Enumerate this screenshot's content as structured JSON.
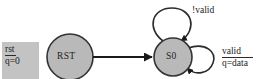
{
  "diagram": {
    "type": "finite-state-machine",
    "canvas": {
      "width": 263,
      "height": 79,
      "background": "#ffffff"
    },
    "colors": {
      "state_fill": "#b9b9b9",
      "state_stroke": "#333333",
      "loop_stroke": "#2b2b2b",
      "arrow": "#1a1a1a",
      "label_box_fill": "#c3c3c3",
      "text": "#1a1a1a"
    },
    "states": [
      {
        "id": "rst",
        "label": "RST",
        "cx": 70,
        "cy": 57,
        "r": 23
      },
      {
        "id": "s0",
        "label": "S0",
        "cx": 173,
        "cy": 57,
        "r": 19
      }
    ],
    "reset_label": {
      "name": "reset-condition",
      "numerator": "rst",
      "denominator": "q=0"
    },
    "transitions": [
      {
        "from": "rst",
        "to": "s0",
        "label": ""
      },
      {
        "from": "s0",
        "to": "s0",
        "label": "!valid",
        "kind": "self-loop-top"
      },
      {
        "from": "s0",
        "to": "s0",
        "numerator": "valid",
        "denominator": "q=data",
        "kind": "self-loop-right"
      }
    ],
    "labels": {
      "not_valid": "!valid",
      "valid_numerator": "valid",
      "valid_denominator": "q=data"
    }
  }
}
